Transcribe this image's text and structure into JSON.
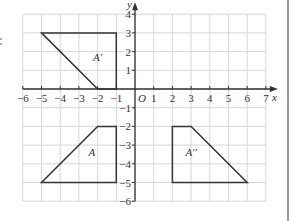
{
  "diagram": {
    "type": "coordinate-grid-transformations",
    "x_axis": {
      "label": "x",
      "min": -6,
      "max": 7,
      "ticks": [
        "-6",
        "-5",
        "-4",
        "-3",
        "-2",
        "-1",
        "1",
        "2",
        "3",
        "4",
        "5",
        "6",
        "7"
      ]
    },
    "y_axis": {
      "label": "y",
      "min": -6,
      "max": 4,
      "ticks": [
        "4",
        "3",
        "2",
        "1",
        "-1",
        "-2",
        "-3",
        "-4",
        "-5",
        "-6"
      ]
    },
    "origin_label": "O",
    "shapes": [
      {
        "name": "A",
        "label": "A",
        "vertices": [
          [
            -5,
            -5
          ],
          [
            -2,
            -2
          ],
          [
            -1,
            -2
          ],
          [
            -1,
            -5
          ]
        ],
        "label_pos": [
          -2.3,
          -3.6
        ]
      },
      {
        "name": "A_prime",
        "label": "A'",
        "vertices": [
          [
            -5,
            3
          ],
          [
            -1,
            3
          ],
          [
            -1,
            0
          ],
          [
            -2,
            0
          ]
        ],
        "label_pos": [
          -2.0,
          1.5
        ]
      },
      {
        "name": "A_double_prime",
        "label": "A''",
        "vertices": [
          [
            2,
            -2
          ],
          [
            3,
            -2
          ],
          [
            6,
            -5
          ],
          [
            2,
            -5
          ]
        ],
        "label_pos": [
          3.0,
          -3.6
        ]
      }
    ],
    "colors": {
      "grid": "#d6d6d6",
      "axis": "#333333",
      "shape": "#333333"
    }
  }
}
